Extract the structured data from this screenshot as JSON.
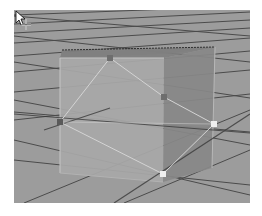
{
  "viewport": {
    "name": "3d-perspective-viewport",
    "background": "#9c9c9c",
    "grid_line_color": "#3a3a3a",
    "object": {
      "type": "cube",
      "state": "selected",
      "front_face_color": "#a9a9a9",
      "right_face_color": "#8a8a8a",
      "top_face_color": "#7e7e7e",
      "wireframe_color": "#d2d2d2"
    },
    "vertex_handles": [
      {
        "id": "v1",
        "x": 96,
        "y": 48,
        "state": "unselected",
        "color": "#6e6e6e"
      },
      {
        "id": "v2",
        "x": 150,
        "y": 87,
        "state": "unselected",
        "color": "#6e6e6e"
      },
      {
        "id": "v3",
        "x": 200,
        "y": 114,
        "state": "selected",
        "color": "#eeeeee"
      },
      {
        "id": "v4",
        "x": 149,
        "y": 164,
        "state": "selected",
        "color": "#eeeeee"
      },
      {
        "id": "v5",
        "x": 46,
        "y": 112,
        "state": "unselected",
        "color": "#6e6e6e"
      }
    ],
    "cursor": {
      "type": "move-arrow",
      "x": 46,
      "y": 112
    }
  }
}
